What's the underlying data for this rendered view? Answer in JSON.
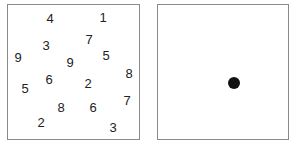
{
  "left_panel": {
    "numbers": [
      {
        "value": "4",
        "x": 50,
        "y": 18
      },
      {
        "value": "1",
        "x": 103,
        "y": 17
      },
      {
        "value": "7",
        "x": 89,
        "y": 39
      },
      {
        "value": "3",
        "x": 46,
        "y": 45
      },
      {
        "value": "9",
        "x": 18,
        "y": 57
      },
      {
        "value": "5",
        "x": 106,
        "y": 55
      },
      {
        "value": "9",
        "x": 70,
        "y": 62
      },
      {
        "value": "8",
        "x": 129,
        "y": 73
      },
      {
        "value": "6",
        "x": 49,
        "y": 79
      },
      {
        "value": "2",
        "x": 88,
        "y": 83
      },
      {
        "value": "5",
        "x": 25,
        "y": 88
      },
      {
        "value": "7",
        "x": 127,
        "y": 100
      },
      {
        "value": "8",
        "x": 61,
        "y": 107
      },
      {
        "value": "6",
        "x": 93,
        "y": 107
      },
      {
        "value": "2",
        "x": 41,
        "y": 122
      },
      {
        "value": "3",
        "x": 113,
        "y": 127
      }
    ]
  },
  "right_panel": {
    "dot": {
      "x": 234,
      "y": 83,
      "color": "#111111"
    }
  }
}
